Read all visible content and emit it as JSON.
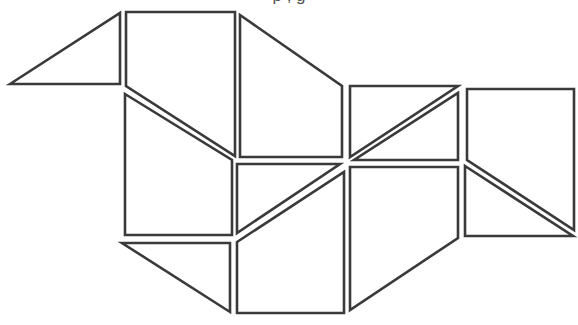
{
  "figure": {
    "caption_clipped": "p                              , g",
    "stroke_color": "#3a3a3a",
    "fill_color": "#ffffff",
    "pieces": [
      {
        "name": "left-triangle",
        "points": "10,84 120,13 120,84"
      },
      {
        "name": "top-left-trapezoid",
        "points": "126,12 235,12 235,156 126,86"
      },
      {
        "name": "top-middle-trapezoid",
        "points": "240,15 342,86 342,157 240,157"
      },
      {
        "name": "left-lower-pentagon",
        "points": "125,94 232,160 232,235 125,235"
      },
      {
        "name": "center-triangle",
        "points": "237,164 340,164 237,233"
      },
      {
        "name": "bottom-left-triangle",
        "points": "122,243 230,243 230,312"
      },
      {
        "name": "bottom-center-trapezoid",
        "points": "237,242 344,172 344,313 237,313"
      },
      {
        "name": "right-middle-upper-triangle",
        "points": "350,86 458,86 350,157"
      },
      {
        "name": "right-middle-lower-triangle",
        "points": "458,93 458,160 354,160"
      },
      {
        "name": "bottom-right-center-trapezoid",
        "points": "350,167 458,167 458,238 350,310"
      },
      {
        "name": "far-right-trapezoid",
        "points": "467,89 574,89 574,230 467,160"
      },
      {
        "name": "far-right-triangle",
        "points": "465,166 573,236 465,236"
      }
    ]
  }
}
